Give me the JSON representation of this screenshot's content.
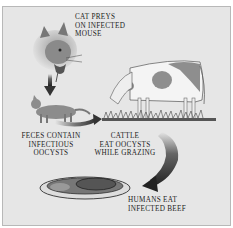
{
  "diagram": {
    "title": "",
    "labels": {
      "cat_preys": [
        "Cat preys",
        "on infected",
        "mouse"
      ],
      "feces": [
        "Feces contain",
        "infectious",
        "oocysts"
      ],
      "cattle": [
        "Cattle",
        "eat oocysts",
        "while grazing"
      ],
      "humans": [
        "Humans eat",
        "infected beef"
      ]
    },
    "nodes": [
      {
        "id": "cat-with-mouse",
        "label": "Cat preys on infected mouse"
      },
      {
        "id": "cat-feces",
        "label": "Feces contain infectious oocysts"
      },
      {
        "id": "cow",
        "label": "Cattle eat oocysts while grazing"
      },
      {
        "id": "beef-plate",
        "label": "Humans eat infected beef"
      }
    ],
    "edges": [
      {
        "from": "cat-with-mouse",
        "to": "cat-feces"
      },
      {
        "from": "cat-feces",
        "to": "cow"
      },
      {
        "from": "cow",
        "to": "beef-plate"
      }
    ],
    "colors": {
      "background": "#e6e6e6",
      "border": "#b8b8b8",
      "text": "#222222",
      "arrow": "#3a3a3a"
    }
  }
}
